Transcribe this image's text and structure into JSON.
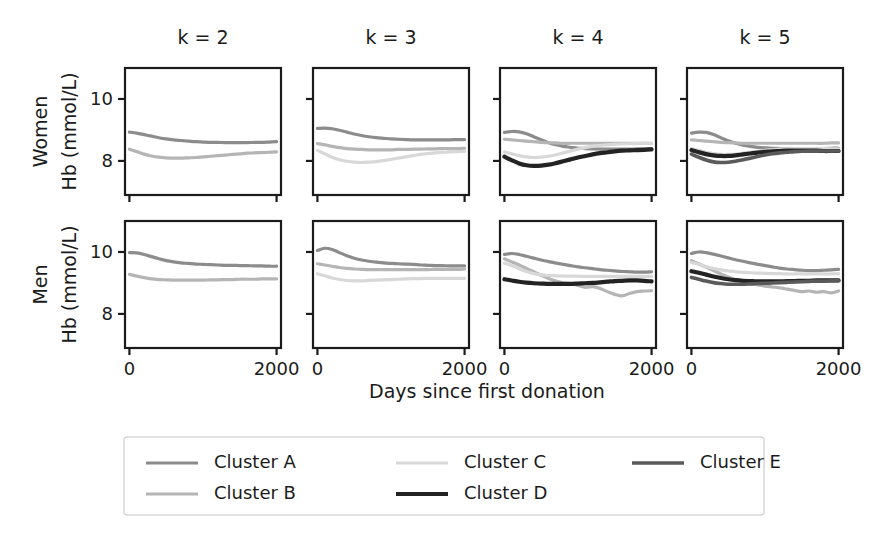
{
  "figure": {
    "xlabel": "Days since first donation",
    "row_labels": [
      "Women",
      "Men"
    ],
    "yaxis_unit": "Hb (mmol/L)",
    "column_titles": [
      "k = 2",
      "k = 3",
      "k = 4",
      "k = 5"
    ],
    "x_ticks": [
      0,
      2000
    ],
    "x_tick_labels": [
      "0",
      "2000"
    ],
    "y_ticks": [
      8,
      10
    ],
    "y_tick_labels": [
      "8",
      "10"
    ],
    "xlim": [
      -60,
      2060
    ],
    "ylim": [
      6.9,
      11.0
    ]
  },
  "legend": {
    "position": "below-figure",
    "columns": 3,
    "entries": [
      {
        "label": "Cluster A",
        "color": "#8c8c8c",
        "width": 3.2
      },
      {
        "label": "Cluster B",
        "color": "#b5b5b5",
        "width": 3.2
      },
      {
        "label": "Cluster C",
        "color": "#d8d8d8",
        "width": 3.2
      },
      {
        "label": "Cluster D",
        "color": "#232323",
        "width": 4.2
      },
      {
        "label": "Cluster E",
        "color": "#5a5a5a",
        "width": 3.6
      }
    ]
  },
  "chart_data": {
    "type": "line",
    "title": "",
    "xlabel": "Days since first donation",
    "ylabel": "Hb (mmol/L)",
    "xlim": [
      -60,
      2060
    ],
    "ylim": [
      6.9,
      11.0
    ],
    "grid": false,
    "legend_position": "bottom",
    "x": [
      0,
      100,
      200,
      300,
      400,
      500,
      600,
      700,
      800,
      900,
      1000,
      1100,
      1200,
      1300,
      1400,
      1500,
      1600,
      1700,
      1800,
      1900,
      2000
    ],
    "panels": [
      {
        "row": "Women",
        "k": 2,
        "title": "k = 2",
        "series": [
          {
            "name": "Cluster A",
            "color": "#8c8c8c",
            "width": 3.2,
            "values": [
              8.93,
              8.9,
              8.85,
              8.8,
              8.75,
              8.71,
              8.68,
              8.66,
              8.64,
              8.62,
              8.61,
              8.6,
              8.6,
              8.59,
              8.59,
              8.59,
              8.59,
              8.6,
              8.6,
              8.61,
              8.62
            ]
          },
          {
            "name": "Cluster B",
            "color": "#b5b5b5",
            "width": 3.2,
            "values": [
              8.38,
              8.3,
              8.22,
              8.16,
              8.12,
              8.1,
              8.09,
              8.09,
              8.1,
              8.11,
              8.13,
              8.15,
              8.17,
              8.19,
              8.21,
              8.23,
              8.25,
              8.26,
              8.27,
              8.28,
              8.29
            ]
          }
        ]
      },
      {
        "row": "Women",
        "k": 3,
        "title": "k = 3",
        "series": [
          {
            "name": "Cluster A",
            "color": "#8c8c8c",
            "width": 3.2,
            "values": [
              9.05,
              9.06,
              9.04,
              8.99,
              8.93,
              8.87,
              8.82,
              8.78,
              8.75,
              8.73,
              8.71,
              8.7,
              8.69,
              8.68,
              8.68,
              8.68,
              8.68,
              8.68,
              8.68,
              8.69,
              8.69
            ]
          },
          {
            "name": "Cluster B",
            "color": "#b5b5b5",
            "width": 3.2,
            "values": [
              8.56,
              8.52,
              8.47,
              8.43,
              8.4,
              8.38,
              8.37,
              8.36,
              8.36,
              8.36,
              8.36,
              8.37,
              8.37,
              8.38,
              8.38,
              8.39,
              8.39,
              8.4,
              8.4,
              8.4,
              8.41
            ]
          },
          {
            "name": "Cluster C",
            "color": "#d8d8d8",
            "width": 3.2,
            "values": [
              8.34,
              8.23,
              8.12,
              8.04,
              7.99,
              7.96,
              7.95,
              7.96,
              7.98,
              8.01,
              8.05,
              8.09,
              8.13,
              8.17,
              8.21,
              8.24,
              8.26,
              8.28,
              8.29,
              8.3,
              8.31
            ]
          }
        ]
      },
      {
        "row": "Women",
        "k": 4,
        "title": "k = 4",
        "series": [
          {
            "name": "Cluster A",
            "color": "#8c8c8c",
            "width": 3.2,
            "values": [
              8.92,
              8.95,
              8.94,
              8.88,
              8.78,
              8.68,
              8.59,
              8.52,
              8.47,
              8.44,
              8.41,
              8.4,
              8.39,
              8.38,
              8.38,
              8.38,
              8.38,
              8.38,
              8.39,
              8.39,
              8.4
            ]
          },
          {
            "name": "Cluster B",
            "color": "#b5b5b5",
            "width": 3.2,
            "values": [
              8.7,
              8.68,
              8.66,
              8.64,
              8.62,
              8.6,
              8.59,
              8.58,
              8.57,
              8.57,
              8.57,
              8.57,
              8.57,
              8.57,
              8.57,
              8.57,
              8.57,
              8.57,
              8.57,
              8.57,
              8.57
            ]
          },
          {
            "name": "Cluster C",
            "color": "#d8d8d8",
            "width": 3.2,
            "values": [
              8.29,
              8.23,
              8.17,
              8.13,
              8.11,
              8.12,
              8.15,
              8.2,
              8.26,
              8.32,
              8.38,
              8.43,
              8.47,
              8.5,
              8.52,
              8.54,
              8.55,
              8.56,
              8.56,
              8.57,
              8.57
            ]
          },
          {
            "name": "Cluster D",
            "color": "#232323",
            "width": 4.2,
            "values": [
              8.14,
              8.02,
              7.92,
              7.86,
              7.84,
              7.85,
              7.88,
              7.93,
              7.99,
              8.05,
              8.11,
              8.16,
              8.21,
              8.25,
              8.28,
              8.31,
              8.33,
              8.34,
              8.35,
              8.36,
              8.37
            ]
          }
        ]
      },
      {
        "row": "Women",
        "k": 5,
        "title": "k = 5",
        "series": [
          {
            "name": "Cluster A",
            "color": "#8c8c8c",
            "width": 3.2,
            "values": [
              8.9,
              8.93,
              8.92,
              8.85,
              8.75,
              8.65,
              8.57,
              8.51,
              8.47,
              8.44,
              8.42,
              8.41,
              8.4,
              8.4,
              8.39,
              8.39,
              8.39,
              8.4,
              8.4,
              8.41,
              8.41
            ]
          },
          {
            "name": "Cluster B",
            "color": "#b5b5b5",
            "width": 3.2,
            "values": [
              8.68,
              8.66,
              8.64,
              8.62,
              8.6,
              8.59,
              8.58,
              8.57,
              8.57,
              8.57,
              8.57,
              8.57,
              8.57,
              8.57,
              8.57,
              8.57,
              8.57,
              8.57,
              8.57,
              8.58,
              8.58
            ]
          },
          {
            "name": "Cluster C",
            "color": "#d8d8d8",
            "width": 3.2,
            "values": [
              8.4,
              8.34,
              8.28,
              8.24,
              8.21,
              8.21,
              8.22,
              8.25,
              8.28,
              8.31,
              8.34,
              8.36,
              8.38,
              8.39,
              8.4,
              8.4,
              8.4,
              8.4,
              8.4,
              8.39,
              8.39
            ]
          },
          {
            "name": "Cluster D",
            "color": "#232323",
            "width": 4.2,
            "values": [
              8.35,
              8.28,
              8.22,
              8.18,
              8.16,
              8.16,
              8.18,
              8.21,
              8.24,
              8.27,
              8.29,
              8.31,
              8.32,
              8.33,
              8.33,
              8.33,
              8.33,
              8.33,
              8.32,
              8.32,
              8.32
            ]
          },
          {
            "name": "Cluster E",
            "color": "#5a5a5a",
            "width": 3.6,
            "values": [
              8.22,
              8.12,
              8.03,
              7.97,
              7.95,
              7.96,
              7.99,
              8.04,
              8.09,
              8.14,
              8.19,
              8.23,
              8.26,
              8.28,
              8.3,
              8.31,
              8.32,
              8.32,
              8.32,
              8.32,
              8.32
            ]
          }
        ]
      },
      {
        "row": "Men",
        "k": 2,
        "title": "k = 2",
        "series": [
          {
            "name": "Cluster A",
            "color": "#8c8c8c",
            "width": 3.2,
            "values": [
              9.98,
              9.97,
              9.92,
              9.85,
              9.78,
              9.72,
              9.68,
              9.65,
              9.63,
              9.61,
              9.6,
              9.59,
              9.58,
              9.57,
              9.57,
              9.56,
              9.56,
              9.55,
              9.55,
              9.54,
              9.54
            ]
          },
          {
            "name": "Cluster B",
            "color": "#b5b5b5",
            "width": 3.2,
            "values": [
              9.28,
              9.22,
              9.17,
              9.13,
              9.11,
              9.1,
              9.09,
              9.09,
              9.09,
              9.09,
              9.09,
              9.1,
              9.1,
              9.11,
              9.11,
              9.12,
              9.12,
              9.12,
              9.13,
              9.13,
              9.13
            ]
          }
        ]
      },
      {
        "row": "Men",
        "k": 3,
        "title": "k = 3",
        "series": [
          {
            "name": "Cluster A",
            "color": "#8c8c8c",
            "width": 3.2,
            "values": [
              10.05,
              10.12,
              10.08,
              9.98,
              9.88,
              9.8,
              9.74,
              9.7,
              9.67,
              9.65,
              9.63,
              9.62,
              9.61,
              9.6,
              9.58,
              9.57,
              9.56,
              9.56,
              9.55,
              9.55,
              9.55
            ]
          },
          {
            "name": "Cluster B",
            "color": "#b5b5b5",
            "width": 3.2,
            "values": [
              9.62,
              9.58,
              9.54,
              9.5,
              9.47,
              9.45,
              9.44,
              9.43,
              9.43,
              9.43,
              9.43,
              9.43,
              9.43,
              9.43,
              9.43,
              9.43,
              9.44,
              9.44,
              9.44,
              9.44,
              9.45
            ]
          },
          {
            "name": "Cluster C",
            "color": "#d8d8d8",
            "width": 3.2,
            "values": [
              9.3,
              9.23,
              9.16,
              9.11,
              9.08,
              9.07,
              9.07,
              9.08,
              9.09,
              9.1,
              9.11,
              9.12,
              9.13,
              9.14,
              9.14,
              9.15,
              9.15,
              9.15,
              9.15,
              9.15,
              9.15
            ]
          }
        ]
      },
      {
        "row": "Men",
        "k": 4,
        "title": "k = 4",
        "series": [
          {
            "name": "Cluster A",
            "color": "#8c8c8c",
            "width": 3.2,
            "values": [
              9.92,
              9.95,
              9.92,
              9.86,
              9.8,
              9.74,
              9.69,
              9.64,
              9.6,
              9.56,
              9.52,
              9.49,
              9.46,
              9.43,
              9.41,
              9.39,
              9.37,
              9.36,
              9.35,
              9.35,
              9.36
            ]
          },
          {
            "name": "Cluster B",
            "color": "#b5b5b5",
            "width": 3.2,
            "values": [
              9.78,
              9.68,
              9.58,
              9.47,
              9.36,
              9.25,
              9.14,
              9.06,
              9.0,
              8.97,
              8.92,
              8.86,
              8.88,
              8.82,
              8.72,
              8.63,
              8.58,
              8.66,
              8.72,
              8.74,
              8.75
            ]
          },
          {
            "name": "Cluster C",
            "color": "#d8d8d8",
            "width": 3.2,
            "values": [
              9.64,
              9.56,
              9.46,
              9.37,
              9.3,
              9.26,
              9.24,
              9.23,
              9.22,
              9.22,
              9.22,
              9.21,
              9.21,
              9.21,
              9.21,
              9.21,
              9.21,
              9.21,
              9.21,
              9.21,
              9.21
            ]
          },
          {
            "name": "Cluster D",
            "color": "#232323",
            "width": 4.2,
            "values": [
              9.12,
              9.08,
              9.04,
              9.01,
              8.99,
              8.98,
              8.97,
              8.97,
              8.97,
              8.97,
              8.98,
              8.99,
              9.0,
              9.02,
              9.04,
              9.06,
              9.07,
              9.08,
              9.08,
              9.07,
              9.05
            ]
          }
        ]
      },
      {
        "row": "Men",
        "k": 5,
        "title": "k = 5",
        "series": [
          {
            "name": "Cluster A",
            "color": "#8c8c8c",
            "width": 3.2,
            "values": [
              9.95,
              10.0,
              9.98,
              9.93,
              9.87,
              9.81,
              9.75,
              9.7,
              9.65,
              9.6,
              9.56,
              9.52,
              9.48,
              9.45,
              9.43,
              9.41,
              9.4,
              9.4,
              9.41,
              9.42,
              9.44
            ]
          },
          {
            "name": "Cluster B",
            "color": "#b5b5b5",
            "width": 3.2,
            "values": [
              9.72,
              9.62,
              9.51,
              9.4,
              9.29,
              9.19,
              9.1,
              9.03,
              8.98,
              8.94,
              8.9,
              8.87,
              8.84,
              8.8,
              8.76,
              8.72,
              8.74,
              8.7,
              8.72,
              8.68,
              8.74
            ]
          },
          {
            "name": "Cluster C",
            "color": "#d8d8d8",
            "width": 3.2,
            "values": [
              9.66,
              9.6,
              9.53,
              9.47,
              9.42,
              9.39,
              9.36,
              9.34,
              9.33,
              9.32,
              9.31,
              9.3,
              9.3,
              9.29,
              9.29,
              9.29,
              9.29,
              9.29,
              9.29,
              9.29,
              9.3
            ]
          },
          {
            "name": "Cluster D",
            "color": "#232323",
            "width": 4.2,
            "values": [
              9.38,
              9.33,
              9.27,
              9.21,
              9.16,
              9.12,
              9.09,
              9.07,
              9.06,
              9.05,
              9.05,
              9.05,
              9.05,
              9.06,
              9.06,
              9.07,
              9.07,
              9.08,
              9.08,
              9.08,
              9.08
            ]
          },
          {
            "name": "Cluster E",
            "color": "#5a5a5a",
            "width": 3.6,
            "values": [
              9.18,
              9.12,
              9.06,
              9.01,
              8.98,
              8.96,
              8.96,
              8.96,
              8.97,
              8.98,
              8.99,
              9.0,
              9.01,
              9.02,
              9.03,
              9.04,
              9.05,
              9.06,
              9.06,
              9.07,
              9.07
            ]
          }
        ]
      }
    ]
  }
}
